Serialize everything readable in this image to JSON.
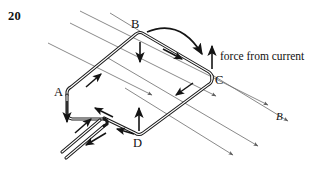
{
  "figure": {
    "number_label": "20",
    "caption_force": "force from current",
    "field_label": "B",
    "corner_labels": {
      "a": "A",
      "b": "B",
      "c": "C",
      "d": "D"
    },
    "colors": {
      "ink": "#111111",
      "wire": "#1a1a1a",
      "field_line": "#6b6b6b",
      "background": "#ffffff"
    }
  },
  "diagram_data": {
    "type": "physics-schematic",
    "subject": "Current-carrying rectangular loop in a uniform magnetic field",
    "loop": {
      "shape": "rectangle-in-perspective",
      "corners": [
        {
          "name": "A",
          "x": 67,
          "y": 95
        },
        {
          "name": "B",
          "x": 140,
          "y": 36
        },
        {
          "name": "C",
          "x": 212,
          "y": 76
        },
        {
          "name": "D",
          "x": 138,
          "y": 135
        }
      ],
      "style": "double-line-thick-wire",
      "corner_radius": 6
    },
    "leads": {
      "description": "twisted pair exiting loop near corner A toward lower left",
      "junction": {
        "x": 100,
        "y": 122
      },
      "end": {
        "x": 57,
        "y": 156
      }
    },
    "current_arrows": [
      {
        "segment": "A-to-B",
        "direction": "up-right",
        "x": 96,
        "y": 79
      },
      {
        "segment": "B-to-C",
        "direction": "down-right",
        "x": 176,
        "y": 56
      },
      {
        "segment": "C-to-D",
        "direction": "down-left",
        "x": 182,
        "y": 91
      },
      {
        "segment": "D-to-A",
        "direction": "up-left",
        "x": 103,
        "y": 112
      },
      {
        "segment": "A-lead",
        "direction": "up-right",
        "x": 84,
        "y": 124
      },
      {
        "segment": "lead-return",
        "direction": "down-left",
        "x": 90,
        "y": 140
      },
      {
        "segment": "D-lead-left",
        "direction": "left",
        "x": 124,
        "y": 131
      }
    ],
    "force_arrows": [
      {
        "label": "force at B",
        "direction": "down",
        "x": 140,
        "y_from": 42,
        "y_to": 66
      },
      {
        "label": "force at C",
        "direction": "up",
        "x": 212,
        "y_from": 69,
        "y_to": 43
      },
      {
        "label": "force at D",
        "direction": "up",
        "x": 139,
        "y_from": 131,
        "y_to": 105
      },
      {
        "label": "force at A",
        "direction": "down",
        "x": 67,
        "y_from": 101,
        "y_to": 126
      }
    ],
    "rotation_arrow": {
      "description": "curved arrow from B arcing over to C indicating torque sense",
      "start": {
        "x": 146,
        "y": 32
      },
      "end": {
        "x": 208,
        "y": 63
      }
    },
    "field_lines": {
      "count": 6,
      "direction": "down-and-to-the-right",
      "slope_deg": 26,
      "arrowheads": true,
      "color": "#6b6b6b"
    },
    "annotations": [
      {
        "text": "force from current",
        "x": 225,
        "y": 57
      },
      {
        "text": "B",
        "x": 278,
        "y": 117,
        "italic": true
      },
      {
        "text": "20",
        "x": 10,
        "y": 11,
        "bold": true
      }
    ]
  }
}
